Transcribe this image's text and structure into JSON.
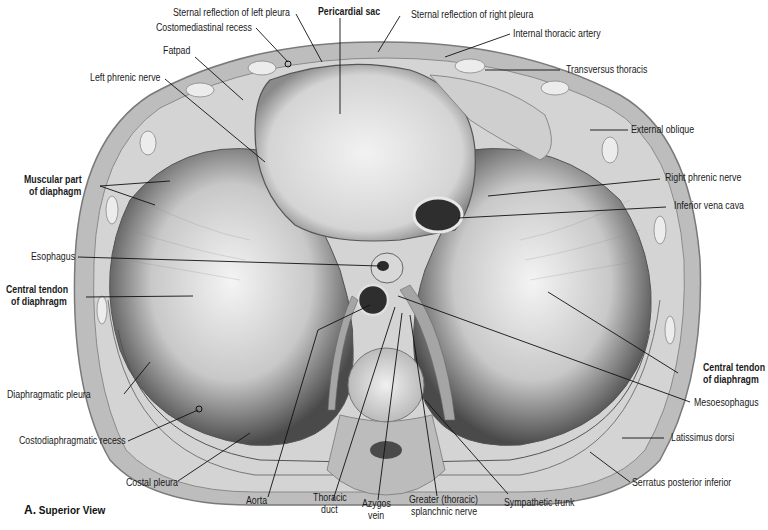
{
  "figure": {
    "caption_letter": "A.",
    "caption_text": "Superior View",
    "labels": {
      "sternal_reflection_left_pleura": "Sternal reflection of left pleura",
      "pericardial_sac": "Pericardial sac",
      "sternal_reflection_right_pleura": "Sternal reflection of right pleura",
      "costomediastinal_recess": "Costomediastinal recess",
      "internal_thoracic_artery": "Internal thoracic artery",
      "fatpad": "Fatpad",
      "transversus_thoracis": "Transversus thoracis",
      "left_phrenic_nerve": "Left phrenic nerve",
      "external_oblique": "External oblique",
      "muscular_part_1": "Muscular part",
      "muscular_part_2": "of diaphagm",
      "right_phrenic_nerve": "Right phrenic nerve",
      "inferior_vena_cava": "Inferior vena cava",
      "esophagus": "Esophagus",
      "central_tendon_left_1": "Central tendon",
      "central_tendon_left_2": "of diaphragm",
      "central_tendon_right_1": "Central tendon",
      "central_tendon_right_2": "of diaphragm",
      "mesoesophagus": "Mesoesophagus",
      "diaphragmatic_pleura": "Diaphragmatic pleura",
      "costodiaphragmatic_recess": "Costodiaphragmatic recess",
      "latissimus_dorsi": "Latissimus dorsi",
      "costal_pleura": "Costal pleura",
      "serratus_posterior_inferior": "Serratus posterior inferior",
      "aorta": "Aorta",
      "thoracic_duct_1": "Thoracic",
      "thoracic_duct_2": "duct",
      "azygos_vein_1": "Azygos",
      "azygos_vein_2": "vein",
      "greater_splanchnic_1": "Greater (thoracic)",
      "greater_splanchnic_2": "splanchnic nerve",
      "sympathetic_trunk": "Sympathetic  trunk"
    }
  }
}
